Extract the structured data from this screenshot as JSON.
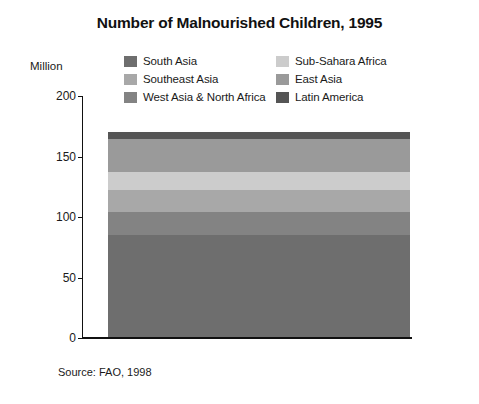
{
  "title": "Number of Malnourished Children, 1995",
  "axis_unit": "Million",
  "source": "Source: FAO, 1998",
  "legend": [
    {
      "label": "South Asia",
      "color": "#6e6e6e"
    },
    {
      "label": "Sub-Sahara Africa",
      "color": "#cccccc"
    },
    {
      "label": "Southeast Asia",
      "color": "#a8a8a8"
    },
    {
      "label": "East Asia",
      "color": "#9a9a9a"
    },
    {
      "label": "West Asia & North Africa",
      "color": "#838383"
    },
    {
      "label": "Latin America",
      "color": "#555555"
    }
  ],
  "ticks": [
    {
      "label": "200",
      "value": 200
    },
    {
      "label": "150",
      "value": 150
    },
    {
      "label": "100",
      "value": 100
    },
    {
      "label": "50",
      "value": 50
    },
    {
      "label": "0",
      "value": 0
    }
  ],
  "chart_data": {
    "type": "bar",
    "subtype": "stacked-single-column",
    "title": "Number of Malnourished Children, 1995",
    "xlabel": "",
    "ylabel": "Million",
    "ylim": [
      0,
      200
    ],
    "yticks": [
      0,
      50,
      100,
      150,
      200
    ],
    "grid": false,
    "legend_position": "top",
    "categories": [
      "1995"
    ],
    "total": 170,
    "series": [
      {
        "name": "South Asia",
        "values": [
          85
        ],
        "color": "#6e6e6e"
      },
      {
        "name": "West Asia & North Africa",
        "values": [
          19
        ],
        "color": "#838383"
      },
      {
        "name": "Southeast Asia",
        "values": [
          18
        ],
        "color": "#a8a8a8"
      },
      {
        "name": "Sub-Sahara Africa",
        "values": [
          15
        ],
        "color": "#cccccc"
      },
      {
        "name": "East Asia",
        "values": [
          27
        ],
        "color": "#9a9a9a"
      },
      {
        "name": "Latin America",
        "values": [
          6
        ],
        "color": "#555555"
      }
    ],
    "annotations": [
      "Source: FAO, 1998"
    ]
  }
}
